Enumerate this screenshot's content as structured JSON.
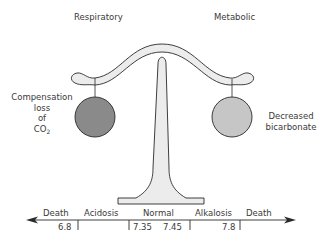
{
  "header": {
    "left_label": "Respiratory",
    "right_label": "Metabolic"
  },
  "left_weight": {
    "label_lines": [
      "Compensation",
      "loss",
      "of",
      "CO"
    ],
    "subscript": "2",
    "color": "#8a8a8a"
  },
  "right_weight": {
    "label_lines": [
      "Decreased",
      "bicarbonate"
    ],
    "color": "#c6c6c6"
  },
  "scale": {
    "beam_color": "#ececec",
    "outline_color": "#2a2a2a"
  },
  "ph_axis": {
    "zones": [
      "Death",
      "Acidosis",
      "Normal",
      "Alkalosis",
      "Death"
    ],
    "ticks": [
      "6.8",
      "7.35",
      "7.45",
      "7.8"
    ]
  }
}
